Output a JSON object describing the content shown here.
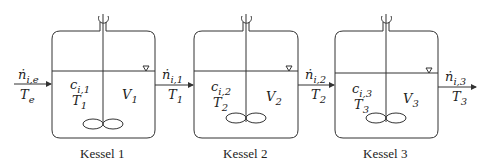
{
  "diagram": {
    "type": "cascade of stirred tank reactors",
    "tanks": [
      {
        "caption": "Kessel 1",
        "conc": "c",
        "conc_sub": "i,1",
        "temp": "T",
        "temp_sub": "1",
        "vol": "V",
        "vol_sub": "1"
      },
      {
        "caption": "Kessel 2",
        "conc": "c",
        "conc_sub": "i,2",
        "temp": "T",
        "temp_sub": "2",
        "vol": "V",
        "vol_sub": "2"
      },
      {
        "caption": "Kessel 3",
        "conc": "c",
        "conc_sub": "i,3",
        "temp": "T",
        "temp_sub": "3",
        "vol": "V",
        "vol_sub": "3"
      }
    ],
    "streams": [
      {
        "flow": "ṅ",
        "flow_sub": "i,e",
        "temp": "T",
        "temp_sub": "e"
      },
      {
        "flow": "ṅ",
        "flow_sub": "i,1",
        "temp": "T",
        "temp_sub": "1"
      },
      {
        "flow": "ṅ",
        "flow_sub": "i,2",
        "temp": "T",
        "temp_sub": "2"
      },
      {
        "flow": "ṅ",
        "flow_sub": "i,3",
        "temp": "T",
        "temp_sub": "3"
      }
    ],
    "level_marker": "▽",
    "colors": {
      "line": "#333333",
      "background": "#ffffff"
    }
  }
}
